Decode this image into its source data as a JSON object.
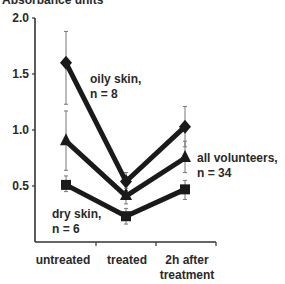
{
  "chart_data": {
    "type": "line",
    "title": "",
    "ylabel": "Absorbance units",
    "xlabel": "",
    "ylim": [
      0,
      2.0
    ],
    "yticks": [
      "0.5",
      "1.0",
      "1.5",
      "2.0"
    ],
    "categories": [
      "untreated",
      "treated",
      "2h after treatment"
    ],
    "category_lines": [
      [
        "untreated"
      ],
      [
        "treated"
      ],
      [
        "2h after",
        "treatment"
      ]
    ],
    "grid": false,
    "legend": "inline annotations",
    "series": [
      {
        "name": "oily skin, n = 8",
        "label_lines": [
          "oily skin,",
          "n = 8"
        ],
        "marker": "diamond",
        "values": [
          1.6,
          0.54,
          1.03
        ],
        "err_low": [
          1.23,
          0.46,
          0.85
        ],
        "err_high": [
          1.88,
          0.62,
          1.21
        ]
      },
      {
        "name": "all volunteers, n = 34",
        "label_lines": [
          "all volunteers,",
          "n = 34"
        ],
        "marker": "triangle",
        "values": [
          0.9,
          0.41,
          0.75
        ],
        "err_low": [
          0.64,
          0.34,
          0.62
        ],
        "err_high": [
          1.17,
          0.48,
          0.9
        ]
      },
      {
        "name": "dry skin, n = 6",
        "label_lines": [
          "dry skin,",
          "n = 6"
        ],
        "marker": "square",
        "values": [
          0.51,
          0.23,
          0.47
        ],
        "err_low": [
          0.45,
          0.16,
          0.38
        ],
        "err_high": [
          0.59,
          0.3,
          0.55
        ]
      }
    ]
  },
  "colors": {
    "line": "#1a1a1a",
    "axis": "#333333",
    "error_bar": "#777777"
  }
}
